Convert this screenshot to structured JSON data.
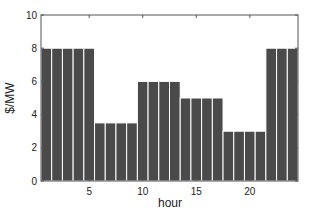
{
  "chart_data": {
    "type": "bar",
    "title": "",
    "xlabel": "hour",
    "ylabel": "$/MW",
    "categories": [
      1,
      2,
      3,
      4,
      5,
      6,
      7,
      8,
      9,
      10,
      11,
      12,
      13,
      14,
      15,
      16,
      17,
      18,
      19,
      20,
      21,
      22,
      23,
      24
    ],
    "values": [
      8,
      8,
      8,
      8,
      8,
      3.5,
      3.5,
      3.5,
      3.5,
      6,
      6,
      6,
      6,
      5,
      5,
      5,
      5,
      3,
      3,
      3,
      3,
      8,
      8,
      8
    ],
    "ylim": [
      0,
      10
    ],
    "xlim": [
      0.5,
      24.5
    ],
    "yticks": [
      0,
      2,
      4,
      6,
      8,
      10
    ],
    "xticks": [
      5,
      10,
      15,
      20
    ],
    "grid": false,
    "legend": null,
    "bar_color": "#4a4a4a",
    "edge_color": "#ffffff"
  }
}
